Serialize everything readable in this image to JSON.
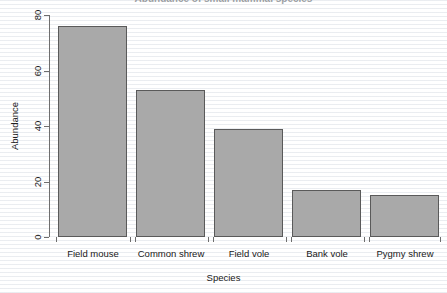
{
  "chart_data": {
    "type": "bar",
    "title": "Abundance of small mammal species",
    "xlabel": "Species",
    "ylabel": "Abundance",
    "categories": [
      "Field mouse",
      "Common shrew",
      "Field vole",
      "Bank vole",
      "Pygmy shrew"
    ],
    "values": [
      76,
      53,
      39,
      17,
      15
    ],
    "ylim": [
      0,
      80
    ],
    "yticks": [
      0,
      20,
      40,
      60,
      80
    ],
    "ytick_labels": [
      "0",
      "20",
      "40",
      "60",
      "80"
    ],
    "grid": false,
    "legend": false,
    "legend_position": "none",
    "bar_color": "#a9a9a9",
    "bar_border_color": "#5a5a5a",
    "axis_color": "#6e6e6e",
    "background_color": "#ffffff",
    "series": [
      {
        "name": "Abundance",
        "values": [
          76,
          53,
          39,
          17,
          15
        ]
      }
    ]
  }
}
